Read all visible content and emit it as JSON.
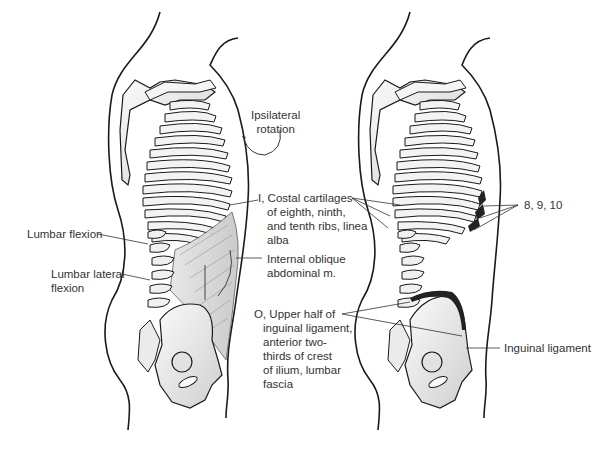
{
  "figure": {
    "panels": [
      {
        "id": "left",
        "labels": {
          "rotation": "Ipsilateral rotation",
          "rotation_line1": "Ipsilateral",
          "rotation_line2": "rotation",
          "lumbar_flexion": "Lumbar flexion",
          "lumbar_lateral_flexion_line1": "Lumbar lateral",
          "lumbar_lateral_flexion_line2": "flexion",
          "insertion_line1": "I, Costal cartilages",
          "insertion_line2": "of eighth, ninth,",
          "insertion_line3": "and tenth ribs, linea",
          "insertion_line4": "alba",
          "muscle_line1": "Internal oblique",
          "muscle_line2": "abdominal m.",
          "origin_line1": "O, Upper half of",
          "origin_line2": "inguinal ligament,",
          "origin_line3": "anterior two-",
          "origin_line4": "thirds of crest",
          "origin_line5": "of ilium, lumbar",
          "origin_line6": "fascia"
        }
      },
      {
        "id": "right",
        "labels": {
          "ribs": "8, 9, 10",
          "inguinal": "Inguinal ligament"
        }
      }
    ],
    "colors": {
      "outline": "#1a1a1a",
      "bone_fill": "#f2f2f2",
      "bone_shade": "#c8c8c8",
      "muscle_fill": "#d9d9d9",
      "attachment_dark": "#222222",
      "text": "#333333"
    }
  }
}
